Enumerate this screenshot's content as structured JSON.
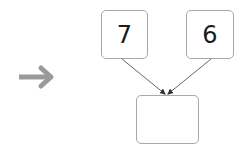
{
  "diagram": {
    "operands": [
      {
        "value": "7"
      },
      {
        "value": "6"
      }
    ],
    "result": {
      "value": ""
    },
    "pointer_arrow": {
      "icon": "right-arrow-icon",
      "color": "#9a9a9a"
    },
    "connector_color": "#555555"
  }
}
